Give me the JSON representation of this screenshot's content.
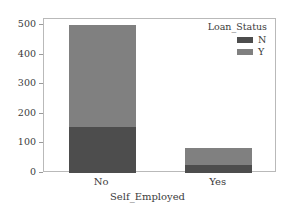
{
  "chart_data": {
    "type": "bar",
    "subtype": "stacked-bar",
    "title": "",
    "xlabel": "Self_Employed",
    "ylabel": "",
    "categories": [
      "No",
      "Yes"
    ],
    "series": [
      {
        "name": "N",
        "values": [
          155,
          26
        ],
        "color": "#4d4d4d"
      },
      {
        "name": "Y",
        "values": [
          345,
          57
        ],
        "color": "#808080"
      }
    ],
    "totals": [
      500,
      83
    ],
    "ylim": [
      0,
      520
    ],
    "yticks": [
      0,
      100,
      200,
      300,
      400,
      500
    ],
    "ytick_labels": [
      "0",
      "100",
      "200",
      "300",
      "400",
      "500"
    ],
    "xtick_labels": [
      "No",
      "Yes"
    ],
    "grid": false,
    "legend": {
      "title": "Loan_Status",
      "position": "upper right",
      "entries": [
        {
          "label": "N",
          "color": "#4d4d4d"
        },
        {
          "label": "Y",
          "color": "#808080"
        }
      ]
    },
    "frame": {
      "color": "#b9b9b9",
      "visible": true
    },
    "background": "#ffffff"
  }
}
